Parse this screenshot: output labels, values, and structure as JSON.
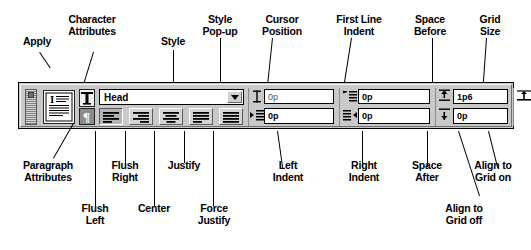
{
  "diagram": {
    "type": "annotated-ui-callout"
  },
  "callouts_top": [
    {
      "id": "apply",
      "label": "Apply"
    },
    {
      "id": "character-attributes",
      "label": "Character\nAttributes"
    },
    {
      "id": "style",
      "label": "Style"
    },
    {
      "id": "style-popup",
      "label": "Style\nPop-up"
    },
    {
      "id": "cursor-position",
      "label": "Cursor\nPosition"
    },
    {
      "id": "first-line-indent",
      "label": "First Line\nIndent"
    },
    {
      "id": "space-before",
      "label": "Space\nBefore"
    },
    {
      "id": "grid-size",
      "label": "Grid\nSize"
    }
  ],
  "callouts_bottom": [
    {
      "id": "paragraph-attributes",
      "label": "Paragraph\nAttributes"
    },
    {
      "id": "flush-right",
      "label": "Flush\nRight"
    },
    {
      "id": "justify",
      "label": "Justify"
    },
    {
      "id": "left-indent",
      "label": "Left\nIndent"
    },
    {
      "id": "right-indent",
      "label": "Right\nIndent"
    },
    {
      "id": "space-after",
      "label": "Space\nAfter"
    },
    {
      "id": "align-to-grid-on",
      "label": "Align to\nGrid on"
    },
    {
      "id": "flush-left",
      "label": "Flush\nLeft"
    },
    {
      "id": "center",
      "label": "Center"
    },
    {
      "id": "force-justify",
      "label": "Force\nJustify"
    },
    {
      "id": "align-to-grid-off",
      "label": "Align to\nGrid off"
    }
  ],
  "palette": {
    "style_field": {
      "value": "Head",
      "popup_icon": "chevron-down-icon"
    },
    "alignment_buttons": [
      {
        "id": "flush-left",
        "icon": "align-left-icon",
        "selected": true
      },
      {
        "id": "flush-right",
        "icon": "align-right-icon",
        "selected": false
      },
      {
        "id": "center",
        "icon": "align-center-icon",
        "selected": false
      },
      {
        "id": "justify",
        "icon": "align-justify-icon",
        "selected": false
      },
      {
        "id": "force-justify",
        "icon": "align-force-icon",
        "selected": false
      }
    ],
    "apply_button": {
      "icon": "apply-page-icon"
    },
    "character_attributes_button": {
      "icon": "capital-t-icon"
    },
    "paragraph_attributes_button": {
      "icon": "pilcrow-icon"
    },
    "fields": [
      {
        "id": "cursor-position",
        "icon": "i-beam-icon",
        "value": "0p",
        "bold": false
      },
      {
        "id": "left-indent",
        "icon": "left-indent-icon",
        "value": "0p",
        "bold": true
      },
      {
        "id": "first-line-indent",
        "icon": "first-line-indent-icon",
        "value": "0p",
        "bold": true
      },
      {
        "id": "right-indent",
        "icon": "right-indent-icon",
        "value": "0p",
        "bold": true
      },
      {
        "id": "space-before",
        "icon": "space-before-icon",
        "value": "1p6",
        "bold": true
      },
      {
        "id": "space-after",
        "icon": "space-after-icon",
        "value": "0p",
        "bold": true
      },
      {
        "id": "grid-size",
        "icon": "grid-lock-icon",
        "value": "0",
        "bold": true
      }
    ],
    "grid_buttons": [
      {
        "id": "align-to-grid-off",
        "icon": "grid-off-icon",
        "selected": false
      },
      {
        "id": "align-to-grid-on",
        "icon": "grid-on-icon",
        "selected": false
      }
    ]
  },
  "colors": {
    "ink": "#000000",
    "face": "#c9c9c9",
    "field": "#ffffff",
    "button": "#d4d4d4",
    "button_pressed": "#b4b4b4"
  }
}
